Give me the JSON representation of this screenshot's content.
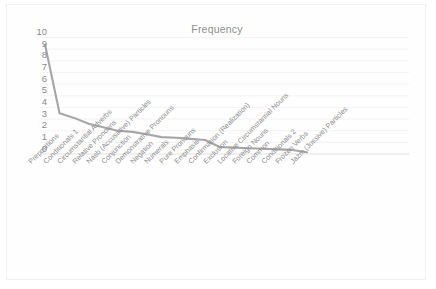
{
  "chart": {
    "title": "Frequency",
    "type": "line"
  },
  "chart_data": {
    "type": "line",
    "title": "Frequency",
    "xlabel": "",
    "ylabel": "",
    "ylim": [
      0,
      10
    ],
    "ytick_step": 1,
    "grid": true,
    "legend": false,
    "line_color": "#a6a6a6",
    "categories": [
      "Prepositions",
      "Conditionals 1",
      "Circumstantial Adverbs",
      "Relative Pronouns",
      "Nasb (Accusative) Particles",
      "Conjunction",
      "Demonstrative Pronouns",
      "Negation",
      "Numerals",
      "Pure Pronouns",
      "Emphasis",
      "Confirmation (Realization)",
      "Exclusion",
      "Locative Circumstantial Nouns",
      "Foreign Nouns",
      "Common",
      "Conditionals 2",
      "Frozen Verbs",
      "Jazm (Jussive) Particles"
    ],
    "values": [
      9.4,
      3.5,
      3.1,
      2.6,
      2.3,
      2.0,
      1.9,
      1.7,
      1.45,
      1.4,
      1.3,
      1.2,
      0.6,
      0.55,
      0.5,
      0.45,
      0.4,
      0.35,
      0.15
    ],
    "ytick_labels": [
      "10",
      "9",
      "8",
      "7",
      "6",
      "5",
      "4",
      "3",
      "2",
      "1",
      "0"
    ]
  }
}
